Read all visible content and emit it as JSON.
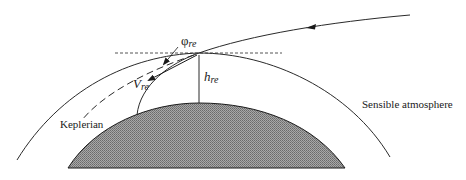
{
  "diagram": {
    "type": "atmospheric-reentry-geometry",
    "labels": {
      "flight_path_angle_symbol": "φ",
      "flight_path_angle_sub": "re",
      "altitude_symbol": "h",
      "altitude_sub": "re",
      "velocity_symbol": "V",
      "velocity_sub": "re",
      "keplerian": "Keplerian",
      "sensible_atmosphere": "Sensible atmosphere"
    },
    "colors": {
      "line": "#2a2a2a",
      "planet_fill": "#9a9a9a",
      "planet_hatch": "#6e6e6e",
      "background": "#ffffff"
    }
  }
}
